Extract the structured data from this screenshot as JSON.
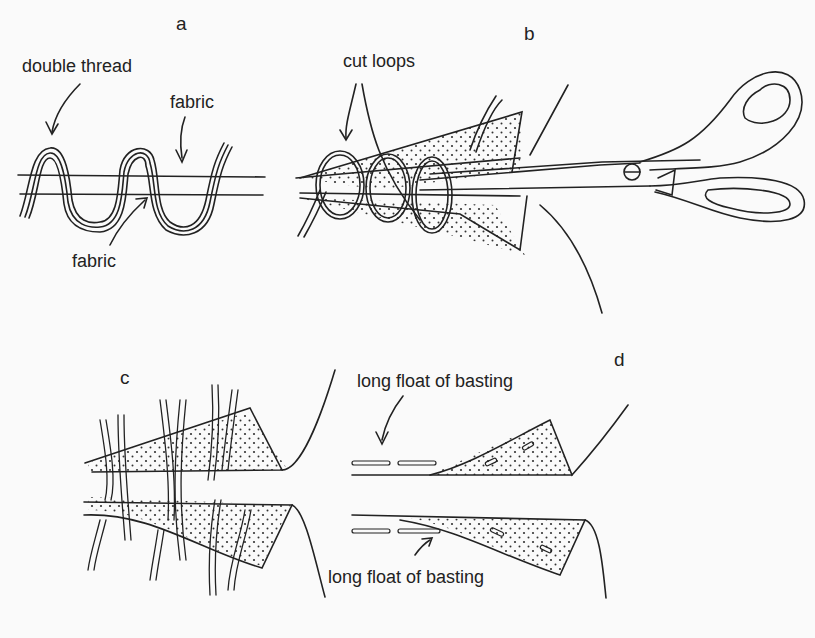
{
  "panels": {
    "a": {
      "letter": "a",
      "labels": {
        "double_thread": "double thread",
        "fabric_top": "fabric",
        "fabric_bottom": "fabric"
      }
    },
    "b": {
      "letter": "b",
      "labels": {
        "cut_loops": "cut loops"
      }
    },
    "c": {
      "letter": "c"
    },
    "d": {
      "letter": "d",
      "labels": {
        "basting_top": "long float of basting",
        "basting_bottom": "long float of basting"
      }
    }
  },
  "colors": {
    "ink": "#222222",
    "paper": "#fafafa"
  }
}
